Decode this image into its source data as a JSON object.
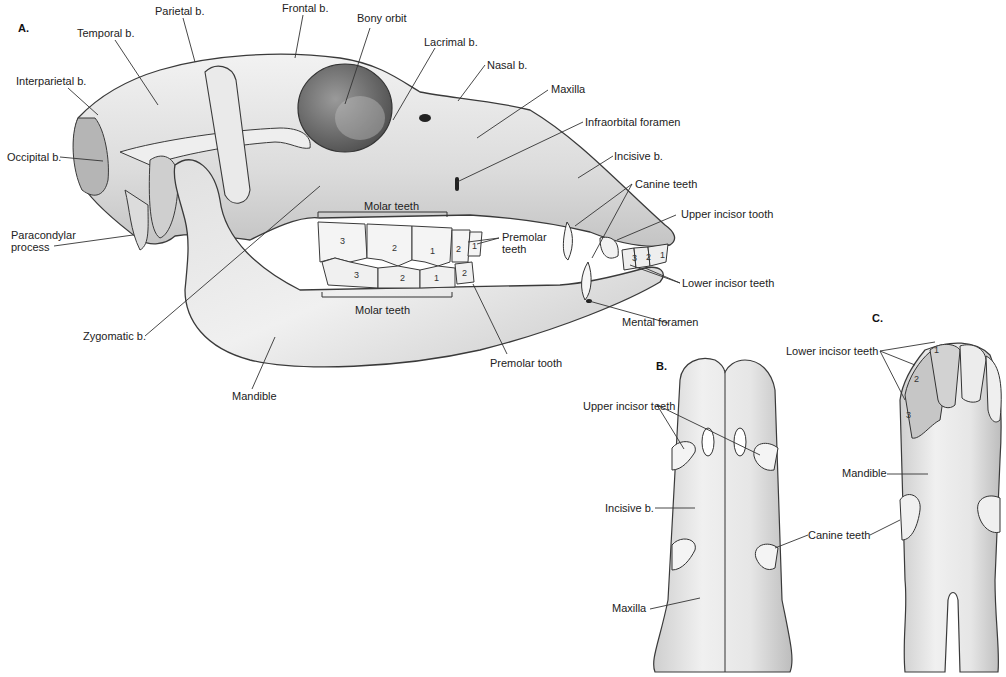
{
  "panels": {
    "a": "A.",
    "b": "B.",
    "c": "C."
  },
  "panel_a_labels": {
    "parietal": "Parietal b.",
    "frontal": "Frontal b.",
    "bony_orbit": "Bony orbit",
    "temporal": "Temporal b.",
    "lacrimal": "Lacrimal b.",
    "interparietal": "Interparietal b.",
    "nasal": "Nasal b.",
    "maxilla": "Maxilla",
    "infraorbital_foramen": "Infraorbital foramen",
    "occipital": "Occipital b.",
    "incisive": "Incisive b.",
    "canine_teeth": "Canine teeth",
    "upper_incisor_tooth": "Upper incisor tooth",
    "paracondylar_1": "Paracondylar",
    "paracondylar_2": "process",
    "molar_teeth_upper": "Molar teeth",
    "premolar_teeth_1": "Premolar",
    "premolar_teeth_2": "teeth",
    "lower_incisor_teeth": "Lower incisor teeth",
    "molar_teeth_lower": "Molar teeth",
    "mental_foramen": "Mental foramen",
    "zygomatic": "Zygomatic b.",
    "premolar_tooth": "Premolar tooth",
    "mandible": "Mandible"
  },
  "tooth_numbers": {
    "upper_molars": [
      "3",
      "2",
      "1"
    ],
    "upper_premolars": [
      "2",
      "1"
    ],
    "lower_molars": [
      "3",
      "2",
      "1"
    ],
    "lower_premolar": [
      "2"
    ],
    "lower_incisors": [
      "3",
      "2",
      "1"
    ]
  },
  "panel_b_labels": {
    "upper_incisor_teeth": "Upper incisor teeth",
    "incisive": "Incisive b.",
    "maxilla": "Maxilla",
    "canine_teeth": "Canine teeth"
  },
  "panel_c_labels": {
    "lower_incisor_teeth": "Lower incisor teeth",
    "mandible": "Mandible",
    "incisor_numbers": [
      "1",
      "2",
      "3"
    ]
  },
  "colors": {
    "bone": "#e8e8e8",
    "bone_shadow": "#b8b8b8",
    "outline": "#3a3a3a",
    "leader": "#333333",
    "background": "#ffffff"
  }
}
